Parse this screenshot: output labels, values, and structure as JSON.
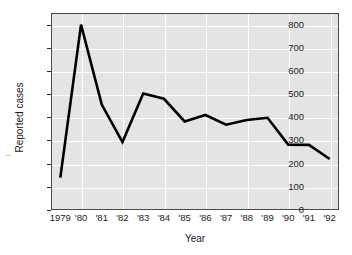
{
  "chart_data": {
    "type": "line",
    "title": "",
    "xlabel": "Year",
    "ylabel": "Reported cases",
    "categories": [
      "1979",
      "'80",
      "'81",
      "'82",
      "'83",
      "'84",
      "'85",
      "'86",
      "'87",
      "'88",
      "'89",
      "'90",
      "'91",
      "'92"
    ],
    "x_values": [
      1979,
      1980,
      1981,
      1982,
      1983,
      1984,
      1985,
      1986,
      1987,
      1988,
      1989,
      1990,
      1991,
      1992
    ],
    "values": [
      140,
      800,
      455,
      293,
      503,
      480,
      382,
      410,
      368,
      388,
      398,
      282,
      281,
      220
    ],
    "series": [
      {
        "name": "Reported cases",
        "values": [
          140,
          800,
          455,
          293,
          503,
          480,
          382,
          410,
          368,
          388,
          398,
          282,
          281,
          220
        ],
        "color": "#000000"
      }
    ],
    "ylim": [
      0,
      850
    ],
    "xlim": [
      1978.55,
      1992.45
    ],
    "y_ticks": [
      0,
      100,
      200,
      300,
      400,
      500,
      600,
      700,
      800
    ],
    "y_tick_labels": [
      "0",
      "100",
      "200",
      "300",
      "400",
      "500",
      "600",
      "700",
      "800"
    ],
    "grid": true,
    "grid_color": "#ffffff",
    "plot_background": "#e4e4e4",
    "axis_color": "#4a4a4a",
    "legend": "none",
    "legend_position": "none"
  }
}
